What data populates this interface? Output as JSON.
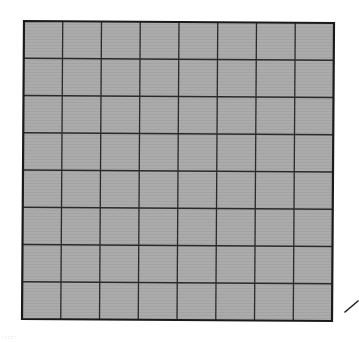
{
  "diagram": {
    "type": "square-grid",
    "rows": 8,
    "columns": 8,
    "total_cells": 64,
    "shaded_cells": 64,
    "fill_color": "#a9a9a9",
    "line_color": "#2a2a2a",
    "border_color": "#1a1a1a",
    "background_color": "#ffffff",
    "corners": {
      "top_left": [
        24,
        21
      ],
      "top_right": [
        334,
        23
      ],
      "bottom_right": [
        332,
        321
      ],
      "bottom_left": [
        22,
        319
      ]
    },
    "pointer_stroke": {
      "from": [
        345,
        312
      ],
      "to": [
        358,
        301
      ]
    },
    "faint_mark_text": "·:::·"
  }
}
